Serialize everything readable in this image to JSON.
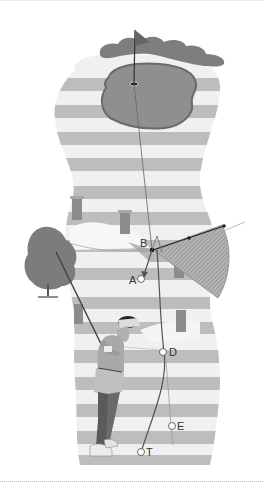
{
  "figure": {
    "colors": {
      "stripe": "#b9b9b9",
      "fairway_light": "#ededed",
      "green": "#8f8f8f",
      "green_edge": "#6e6e6e",
      "trees": "#7d7d7d",
      "post": "#8a8a8a",
      "hatch": "#999999"
    },
    "labels": {
      "a": "A",
      "b": "B",
      "d": "D",
      "e": "E",
      "t": "T"
    }
  }
}
